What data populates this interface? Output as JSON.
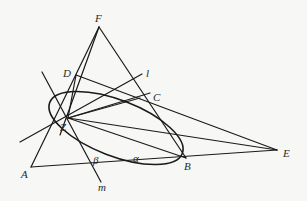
{
  "diagram": {
    "type": "projective-geometry-figure",
    "points": [
      {
        "id": "F",
        "label": "F",
        "x": 99,
        "y": 27,
        "lx": 95,
        "ly": 22
      },
      {
        "id": "D",
        "label": "D",
        "x": 76,
        "y": 75,
        "lx": 63,
        "ly": 77
      },
      {
        "id": "C",
        "label": "C",
        "x": 150,
        "y": 93,
        "lx": 153,
        "ly": 101
      },
      {
        "id": "B",
        "label": "B",
        "x": 186,
        "y": 158,
        "lx": 184,
        "ly": 170
      },
      {
        "id": "E",
        "label": "E",
        "x": 277,
        "y": 150,
        "lx": 283,
        "ly": 157
      },
      {
        "id": "A",
        "label": "A",
        "x": 31,
        "y": 167,
        "lx": 21,
        "ly": 178
      },
      {
        "id": "Z",
        "label": "Z",
        "x": 68,
        "y": 118,
        "lx": 60,
        "ly": 131
      }
    ],
    "line_labels": [
      {
        "id": "l",
        "label": "l",
        "lx": 146,
        "ly": 77
      },
      {
        "id": "m",
        "label": "m",
        "lx": 98,
        "ly": 191
      }
    ],
    "angle_labels": [
      {
        "id": "alpha",
        "label": "α",
        "lx": 133,
        "ly": 162
      },
      {
        "id": "beta",
        "label": "β",
        "lx": 93,
        "ly": 164
      }
    ],
    "conic": {
      "type": "ellipse",
      "cx": 116,
      "cy": 127,
      "rx": 70,
      "ry": 30,
      "rotation": 19
    },
    "segments": [
      [
        "A",
        "F"
      ],
      [
        "F",
        "B"
      ],
      [
        "A",
        "E"
      ],
      [
        "D",
        "E"
      ],
      [
        "F",
        "Z"
      ],
      [
        "D",
        "Z"
      ],
      [
        "Z",
        "E"
      ],
      [
        "Z",
        "C"
      ],
      [
        "Z",
        "B"
      ]
    ],
    "lines": [
      {
        "id": "l",
        "x1": 27,
        "y1": 140,
        "x2": 144,
        "y2": 71
      },
      {
        "id": "m",
        "x1": 43,
        "y1": 73,
        "x2": 101,
        "y2": 182
      }
    ]
  }
}
